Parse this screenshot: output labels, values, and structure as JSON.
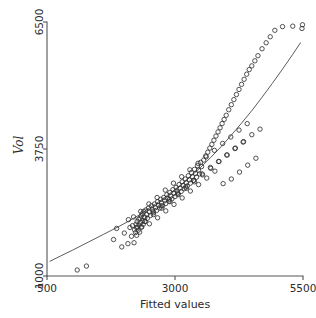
{
  "chart_data": {
    "type": "scatter",
    "title": "",
    "xlabel": "Fitted values",
    "ylabel": "Vol",
    "xlim": [
      500,
      5500
    ],
    "ylim": [
      1000,
      6500
    ],
    "xticks": [
      500,
      3000,
      5500
    ],
    "xticklabels": [
      "500",
      "3000",
      "5500"
    ],
    "yticks": [
      1000,
      3750,
      6500
    ],
    "yticklabels": [
      "1000",
      "3750",
      "6500"
    ],
    "grid": false,
    "legend": "none",
    "marker": "open-circle",
    "marker_color": "#333333",
    "line_color": "#4a4a4a",
    "axis_color": "#545454",
    "series": [
      {
        "name": "observations",
        "x": [
          1090,
          1270,
          1800,
          1960,
          1860,
          2010,
          2080,
          2120,
          2150,
          2170,
          2200,
          2210,
          2230,
          2240,
          2250,
          2260,
          2270,
          2280,
          2290,
          2300,
          2310,
          2320,
          2330,
          2340,
          2350,
          2360,
          2370,
          2380,
          2390,
          2400,
          2410,
          2430,
          2450,
          2460,
          2480,
          2500,
          2520,
          2540,
          2560,
          2580,
          2600,
          2620,
          2640,
          2660,
          2680,
          2700,
          2720,
          2740,
          2760,
          2780,
          2800,
          2820,
          2840,
          2860,
          2880,
          2900,
          2920,
          2940,
          2960,
          2980,
          3000,
          3020,
          3040,
          3060,
          3080,
          3100,
          3120,
          3140,
          3160,
          3180,
          3200,
          3220,
          3240,
          3260,
          3280,
          3300,
          3320,
          3340,
          3360,
          3380,
          3400,
          3420,
          3440,
          3460,
          3480,
          3500,
          3520,
          3560,
          3600,
          3640,
          3680,
          3720,
          3760,
          3800,
          3840,
          3880,
          3920,
          3960,
          4000,
          4050,
          4100,
          4150,
          4200,
          4250,
          4300,
          4350,
          4400,
          4450,
          4500,
          4560,
          4620,
          4700,
          4780,
          4860,
          4950,
          5100,
          5300,
          5480,
          5490,
          2090,
          2190,
          2250,
          2330,
          2410,
          2490,
          2570,
          2650,
          2730,
          2810,
          2890,
          2970,
          3050,
          3130,
          3210,
          3290,
          3370,
          3450,
          3530,
          3610,
          3690,
          3770,
          3850,
          3930,
          4010,
          4090,
          4170,
          4250,
          4330,
          4410,
          2340,
          2420,
          2500,
          2580,
          2660,
          2740,
          2820,
          2900,
          2980,
          3060,
          3140,
          3220,
          3300,
          3380,
          3460,
          3540,
          3620,
          3700,
          3780,
          3860,
          3940,
          4020,
          4100,
          4180,
          4260,
          4340,
          4420,
          4500,
          4580,
          4660
        ],
        "y": [
          1130,
          1215,
          1790,
          1630,
          2030,
          1930,
          1700,
          2050,
          1860,
          2090,
          1720,
          2000,
          1940,
          2120,
          1880,
          2180,
          2060,
          1990,
          2230,
          2100,
          1950,
          2250,
          2160,
          2300,
          2060,
          2350,
          2200,
          2120,
          2400,
          2280,
          2180,
          2430,
          2330,
          2250,
          2470,
          2390,
          2310,
          2520,
          2440,
          2370,
          2560,
          2480,
          2420,
          2610,
          2530,
          2470,
          2660,
          2580,
          2520,
          2700,
          2630,
          2570,
          2760,
          2680,
          2620,
          2810,
          2730,
          2670,
          2870,
          2790,
          2720,
          2920,
          2840,
          2780,
          2980,
          2900,
          2830,
          3040,
          2960,
          2890,
          3100,
          3020,
          2950,
          3170,
          3080,
          3010,
          3240,
          3150,
          3070,
          3310,
          3220,
          3140,
          3390,
          3290,
          3210,
          3460,
          3370,
          3510,
          3600,
          3680,
          3770,
          3850,
          3940,
          4030,
          4120,
          4210,
          4300,
          4390,
          4480,
          4600,
          4710,
          4820,
          4930,
          5040,
          5150,
          5260,
          5370,
          5470,
          5550,
          5660,
          5770,
          5920,
          6050,
          6180,
          6320,
          6400,
          6410,
          6360,
          6440,
          2220,
          2280,
          2050,
          2400,
          2260,
          2560,
          2400,
          2700,
          2520,
          2860,
          2660,
          3010,
          2800,
          3150,
          2930,
          3300,
          3070,
          3440,
          3210,
          3580,
          3350,
          3720,
          3480,
          3870,
          3620,
          4010,
          3760,
          4160,
          3900,
          4300,
          2060,
          2180,
          2130,
          2330,
          2260,
          2470,
          2410,
          2610,
          2550,
          2760,
          2690,
          2900,
          2840,
          3040,
          2980,
          3190,
          3120,
          3330,
          3270,
          3480,
          3000,
          3620,
          3100,
          3770,
          3250,
          3910,
          3400,
          4060,
          3550,
          4180
        ]
      }
    ],
    "fit_line": {
      "name": "fitted-curve",
      "x": [
        560,
        760,
        1000,
        1300,
        1600,
        1900,
        2100,
        2300,
        2500,
        2700,
        2900,
        3100,
        3300,
        3500,
        3700,
        3900,
        4100,
        4300,
        4500,
        4700,
        4900,
        5100,
        5300,
        5450
      ],
      "y": [
        1320,
        1430,
        1560,
        1730,
        1900,
        2070,
        2190,
        2320,
        2470,
        2620,
        2790,
        2960,
        3150,
        3350,
        3570,
        3800,
        4050,
        4310,
        4580,
        4870,
        5170,
        5480,
        5800,
        6050
      ]
    }
  }
}
